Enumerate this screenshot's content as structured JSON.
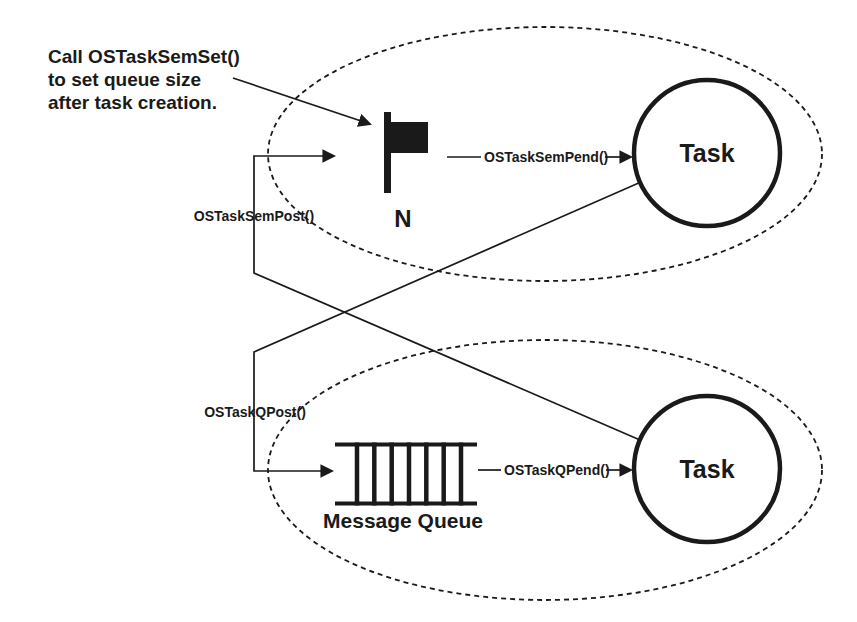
{
  "colors": {
    "ink": "#1a1a1a",
    "background": "#ffffff"
  },
  "callout": {
    "line1": "Call OSTaskSemSet()",
    "line2": "to set queue size",
    "line3": "after task creation."
  },
  "semaphore": {
    "icon": "flag-icon",
    "count_label": "N",
    "pend_label": "OSTaskSemPend()",
    "post_label": "OSTaskSemPost()"
  },
  "queue": {
    "icon": "message-queue-icon",
    "label": "Message Queue",
    "pend_label": "OSTaskQPend()",
    "post_label": "OSTaskQPost()"
  },
  "tasks": {
    "top_label": "Task",
    "bottom_label": "Task"
  }
}
